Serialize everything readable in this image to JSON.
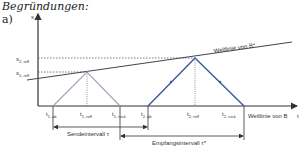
{
  "heading": "Begründungen:",
  "part_label": "a)",
  "axes": {
    "x_axis_label": "x",
    "t_axis_label": "t",
    "t_axis_caption": "Weltlinie von B"
  },
  "levels": {
    "x2_reff": "x",
    "x2_reff_sub": "2, reff",
    "x1_reff": "x",
    "x1_reff_sub": "1, reff"
  },
  "worldline_b_star": "Weltlinie von B*",
  "time_labels": [
    {
      "main": "t",
      "sub": "1, ab"
    },
    {
      "main": "t",
      "sub": "1, reff"
    },
    {
      "main": "t",
      "sub": "1, rück"
    },
    {
      "main": "t",
      "sub": "2, ab"
    },
    {
      "main": "t",
      "sub": "2, reff"
    },
    {
      "main": "t",
      "sub": "2, rück"
    }
  ],
  "intervals": {
    "send": "Sendeintervall τ",
    "receive": "Empfangsintervall τ*"
  },
  "colors": {
    "axis": "#333333",
    "signal_1": "#9aa8b8",
    "signal_2": "#3a5a9a",
    "worldline": "#444444"
  }
}
